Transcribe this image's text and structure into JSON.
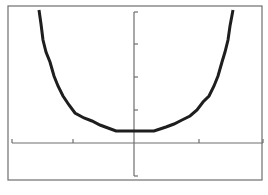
{
  "window": {
    "frame_color": "#6e6e6e",
    "axis_color": "#6e6e6e",
    "curve_color": "#1e1e1e",
    "background": "#ffffff"
  },
  "chart_data": {
    "type": "line",
    "title": "",
    "xlabel": "",
    "ylabel": "",
    "grid": false,
    "legend": null,
    "frame_px": {
      "left": 8,
      "top": 6,
      "right": 262,
      "bottom": 180
    },
    "origin_px": {
      "x": 134,
      "y": 143
    },
    "x_ticks_px": [
      12,
      73,
      134,
      199,
      263
    ],
    "y_ticks_px": [
      12,
      44,
      77,
      110,
      143,
      176
    ],
    "x_unit_px": 62,
    "y_unit_px": 33,
    "xlim": [
      -2,
      2
    ],
    "ylim": [
      -1,
      4
    ],
    "series": [
      {
        "name": "curve",
        "points_px": [
          [
            39,
            10
          ],
          [
            41,
            24
          ],
          [
            43,
            40
          ],
          [
            46,
            52
          ],
          [
            50,
            62
          ],
          [
            54,
            76
          ],
          [
            58,
            86
          ],
          [
            63,
            96
          ],
          [
            69,
            105
          ],
          [
            75,
            113
          ],
          [
            84,
            118
          ],
          [
            92,
            121
          ],
          [
            100,
            125
          ],
          [
            108,
            128
          ],
          [
            116,
            131
          ],
          [
            134,
            131
          ],
          [
            154,
            131
          ],
          [
            160,
            129
          ],
          [
            166,
            127
          ],
          [
            174,
            124
          ],
          [
            182,
            120
          ],
          [
            190,
            116
          ],
          [
            197,
            110
          ],
          [
            203,
            102
          ],
          [
            209,
            96
          ],
          [
            214,
            86
          ],
          [
            218,
            76
          ],
          [
            222,
            62
          ],
          [
            225,
            52
          ],
          [
            228,
            40
          ],
          [
            230,
            26
          ],
          [
            233,
            10
          ]
        ],
        "approx_values": {
          "min_y": 0.36,
          "min_x": 0
        }
      }
    ]
  }
}
